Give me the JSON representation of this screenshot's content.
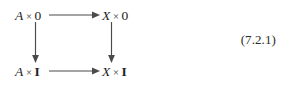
{
  "figure": {
    "kind": "commutative-diagram",
    "shape": "square",
    "equation_number": "(7.2.1)",
    "background_color": "#ffffff",
    "ink_color": "#2b2b2b",
    "arrow_color": "#4a4a4a",
    "vertices": {
      "top_left": {
        "full_text": "A × 0",
        "object": "A",
        "operator": "×",
        "factor": "0"
      },
      "top_right": {
        "full_text": "X × 0",
        "object": "X",
        "operator": "×",
        "factor": "0"
      },
      "bottom_left": {
        "full_text": "A × I",
        "object": "A",
        "operator": "×",
        "factor": "I"
      },
      "bottom_right": {
        "full_text": "X × I",
        "object": "X",
        "operator": "×",
        "factor": "I"
      }
    },
    "arrows": [
      {
        "id": "top-horizontal",
        "from": "top_left",
        "to": "top_right",
        "direction": "right",
        "label": ""
      },
      {
        "id": "bottom-horizontal",
        "from": "bottom_left",
        "to": "bottom_right",
        "direction": "right",
        "label": ""
      },
      {
        "id": "left-vertical",
        "from": "top_left",
        "to": "bottom_left",
        "direction": "down",
        "label": ""
      },
      {
        "id": "right-vertical",
        "from": "top_right",
        "to": "bottom_right",
        "direction": "down",
        "label": ""
      }
    ]
  }
}
